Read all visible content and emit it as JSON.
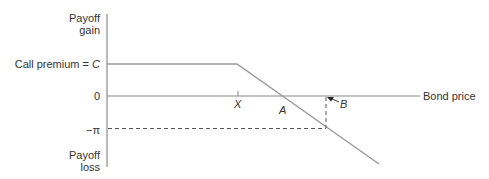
{
  "diagram": {
    "y_axis": {
      "top_label_line1": "Payoff",
      "top_label_line2": "gain",
      "bottom_label_line1": "Payoff",
      "bottom_label_line2": "loss"
    },
    "levels": {
      "premium_label_prefix": "Call premium = ",
      "premium_symbol": "C",
      "zero_label": "0",
      "neg_label": "−π"
    },
    "x_axis": {
      "label": "Bond price",
      "strike_label": "X"
    },
    "points": {
      "a_label": "A",
      "b_label": "B"
    },
    "colors": {
      "payoff_line": "#9a9a9a",
      "axis": "#8a8a8a",
      "dashed": "#555555",
      "text": "#333333"
    }
  }
}
